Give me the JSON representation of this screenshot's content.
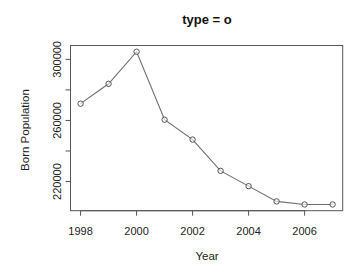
{
  "chart_data": {
    "type": "line",
    "title": "type = o",
    "xlabel": "Year",
    "ylabel": "Born Population",
    "x": [
      1998,
      1999,
      2000,
      2001,
      2002,
      2003,
      2004,
      2005,
      2006,
      2007
    ],
    "series": [
      {
        "name": "Born Population",
        "values": [
          271000,
          284000,
          305000,
          260500,
          247500,
          227000,
          217000,
          207000,
          205000,
          205000
        ],
        "marker": "open-circle",
        "line": true
      }
    ],
    "x_ticks": [
      1998,
      2000,
      2002,
      2004,
      2006
    ],
    "x_tick_labels": [
      "1998",
      "2000",
      "2002",
      "2004",
      "2006"
    ],
    "y_ticks": [
      220000,
      240000,
      260000,
      280000,
      300000
    ],
    "y_tick_labels": [
      "220000",
      "",
      "260000",
      "",
      "300000"
    ],
    "xlim": [
      1997.64,
      2007.36
    ],
    "ylim": [
      200920,
      309080
    ],
    "grid": false,
    "legend": null,
    "colors": {
      "line": "#6e6e6e",
      "marker": "#555555",
      "axis": "#555555",
      "text": "#222222"
    }
  }
}
